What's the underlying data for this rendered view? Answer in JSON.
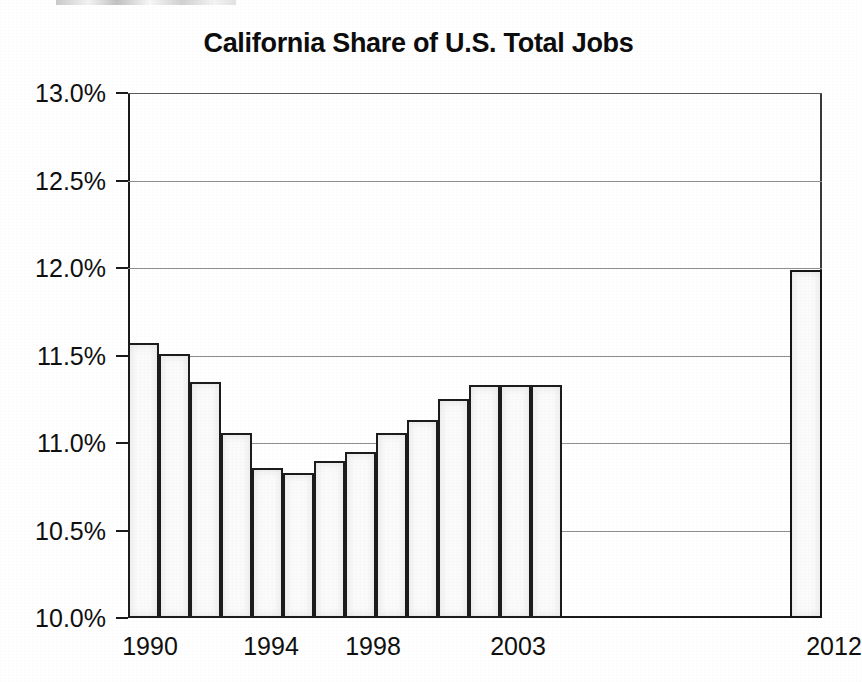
{
  "chart_data": {
    "type": "bar",
    "title": "California Share of U.S. Total Jobs",
    "xlabel": "",
    "ylabel": "",
    "ylim": [
      10.0,
      13.0
    ],
    "ytick_values": [
      13.0,
      12.5,
      12.0,
      11.5,
      11.0,
      10.5,
      10.0
    ],
    "ytick_labels": [
      "13.0%",
      "12.5%",
      "12.0%",
      "11.5%",
      "11.0%",
      "10.5%",
      "10.0%"
    ],
    "grid": true,
    "grid_axis": "y",
    "legend": null,
    "xtick_labels": [
      "1990",
      "1994",
      "1998",
      "2003",
      "2012"
    ],
    "xtick_categories": [
      "1990",
      "1994",
      "1998",
      "2003",
      "2012"
    ],
    "categories": [
      "1990",
      "1991",
      "1992",
      "1993",
      "1994",
      "1995",
      "1996",
      "1997",
      "1998",
      "1999",
      "2000",
      "2001",
      "2002",
      "2003",
      "2012"
    ],
    "values": [
      11.57,
      11.51,
      11.35,
      11.06,
      10.86,
      10.83,
      10.9,
      10.95,
      11.06,
      11.13,
      11.25,
      11.33,
      11.33,
      11.33,
      11.99
    ],
    "gap_between": "2003-2012",
    "units": "percent",
    "bar_style": {
      "fill": "#fbfbfb",
      "edge": "#1c1c1c"
    }
  },
  "axis": {
    "y_ticks": [
      {
        "label": "13.0%",
        "value": 13.0
      },
      {
        "label": "12.5%",
        "value": 12.5
      },
      {
        "label": "12.0%",
        "value": 12.0
      },
      {
        "label": "11.5%",
        "value": 11.5
      },
      {
        "label": "11.0%",
        "value": 11.0
      },
      {
        "label": "10.5%",
        "value": 10.5
      },
      {
        "label": "10.0%",
        "value": 10.0
      }
    ],
    "x_ticks": [
      {
        "label": "1990",
        "pos": 122
      },
      {
        "label": "1994",
        "pos": 243
      },
      {
        "label": "1998",
        "pos": 345
      },
      {
        "label": "2003",
        "pos": 490
      },
      {
        "label": "2012",
        "pos": 806
      }
    ]
  },
  "bars": [
    {
      "category": "1990",
      "value": 11.57,
      "x": 128,
      "width": 31
    },
    {
      "category": "1991",
      "value": 11.51,
      "x": 159,
      "width": 31
    },
    {
      "category": "1992",
      "value": 11.35,
      "x": 190,
      "width": 31
    },
    {
      "category": "1993",
      "value": 11.06,
      "x": 221,
      "width": 31
    },
    {
      "category": "1994",
      "value": 10.86,
      "x": 252,
      "width": 31
    },
    {
      "category": "1995",
      "value": 10.83,
      "x": 283,
      "width": 31
    },
    {
      "category": "1996",
      "value": 10.9,
      "x": 314,
      "width": 31
    },
    {
      "category": "1997",
      "value": 10.95,
      "x": 345,
      "width": 31
    },
    {
      "category": "1998",
      "value": 11.06,
      "x": 376,
      "width": 31
    },
    {
      "category": "1999",
      "value": 11.13,
      "x": 407,
      "width": 31
    },
    {
      "category": "2000",
      "value": 11.25,
      "x": 438,
      "width": 31
    },
    {
      "category": "2001",
      "value": 11.33,
      "x": 469,
      "width": 31
    },
    {
      "category": "2002",
      "value": 11.33,
      "x": 500,
      "width": 31
    },
    {
      "category": "2003",
      "value": 11.33,
      "x": 531,
      "width": 31
    },
    {
      "category": "2012",
      "value": 11.99,
      "x": 790,
      "width": 32
    }
  ]
}
